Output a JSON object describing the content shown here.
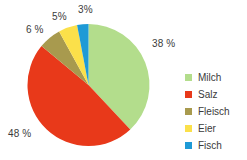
{
  "chart_data": {
    "type": "pie",
    "title": "",
    "categories": [
      "Milch",
      "Salz",
      "Fleisch",
      "Eier",
      "Fisch"
    ],
    "values": [
      38,
      48,
      6,
      5,
      3
    ],
    "value_labels": [
      "38 %",
      "48 %",
      "6 %",
      "5%",
      "3%"
    ],
    "colors": [
      "#b3dd8c",
      "#e8391a",
      "#a89a4e",
      "#fbe04a",
      "#1e9ad6"
    ],
    "units": "percent",
    "start_angle_deg": 0,
    "direction": "clockwise",
    "legend_position": "right",
    "grid": false,
    "xlabel": "",
    "ylabel": ""
  },
  "labels": {
    "milch": "38 %",
    "salz": "48 %",
    "fleisch": "6 %",
    "eier": "5%",
    "fisch": "3%"
  },
  "legend": {
    "items": [
      {
        "label": "Milch",
        "color": "#b3dd8c"
      },
      {
        "label": "Salz",
        "color": "#e8391a"
      },
      {
        "label": "Fleisch",
        "color": "#a89a4e"
      },
      {
        "label": "Eier",
        "color": "#fbe04a"
      },
      {
        "label": "Fisch",
        "color": "#1e9ad6"
      }
    ]
  }
}
